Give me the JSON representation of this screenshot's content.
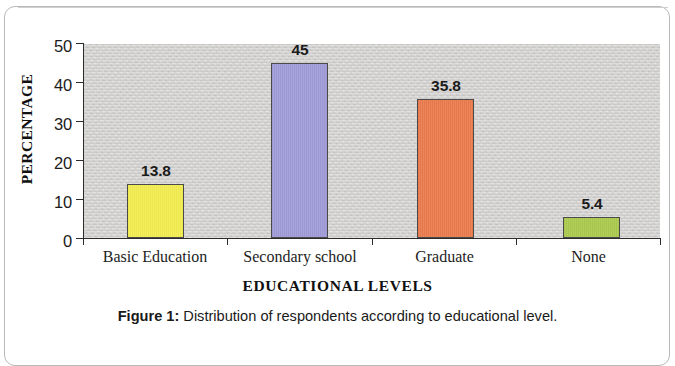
{
  "figure": {
    "caption_label": "Figure 1:",
    "caption_text": " Distribution of respondents according to educational level."
  },
  "chart_data": {
    "type": "bar",
    "title": "",
    "subtitle": "",
    "xlabel": "EDUCATIONAL LEVELS",
    "ylabel": "PERCENTAGE",
    "categories": [
      "Basic Education",
      "Secondary school",
      "Graduate",
      "None"
    ],
    "values": [
      13.8,
      45,
      35.8,
      5.4
    ],
    "value_labels": [
      "13.8",
      "45",
      "35.8",
      "5.4"
    ],
    "bar_colors": [
      "#fbf53f",
      "#9b96dc",
      "#f2703c",
      "#a8cc3c"
    ],
    "ylim": [
      0,
      50
    ],
    "ytick_labels": [
      "0",
      "10",
      "20",
      "30",
      "40",
      "50"
    ],
    "ytick_values": [
      0,
      10,
      20,
      30,
      40,
      50
    ],
    "grid": false,
    "legend": false,
    "legend_position": "none",
    "plot_background_color": "#d4d3d1",
    "axis_color": "#2b2b2b"
  }
}
